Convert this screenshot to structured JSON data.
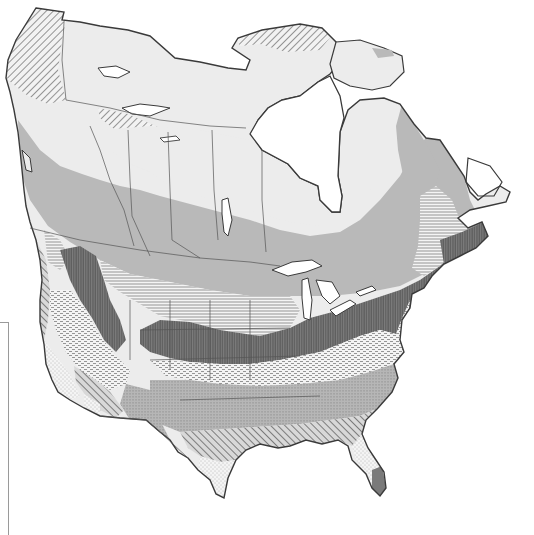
{
  "map": {
    "subject": "North America zonal map (monochrome, pattern-filled regions)",
    "colors": {
      "background": "#ffffff",
      "water": "#ffffff",
      "outline": "#3a3a3a",
      "boundary": "#555555",
      "tundra_light": "#ececec",
      "boreal_gray": "#b9b9b9",
      "dark_band": "#6e6e6e",
      "florida_tip": "#7a7a7a"
    },
    "zones": [
      {
        "id": "arctic-diagonal",
        "pattern": "diagonal-hatch"
      },
      {
        "id": "tundra",
        "pattern": "light-gray-solid"
      },
      {
        "id": "boreal",
        "pattern": "medium-gray-solid"
      },
      {
        "id": "horizontal-lines",
        "pattern": "horizontal-hatch"
      },
      {
        "id": "vertical-dark",
        "pattern": "dense-vertical-hatch"
      },
      {
        "id": "dashed-light",
        "pattern": "dash-dots"
      },
      {
        "id": "southern-vertical-gray",
        "pattern": "gray-vertical-dots"
      },
      {
        "id": "southeast-diagonal",
        "pattern": "diagonal-hatch"
      },
      {
        "id": "stippled",
        "pattern": "fine-stipple"
      },
      {
        "id": "south-florida",
        "pattern": "dark-gray-solid"
      }
    ]
  }
}
